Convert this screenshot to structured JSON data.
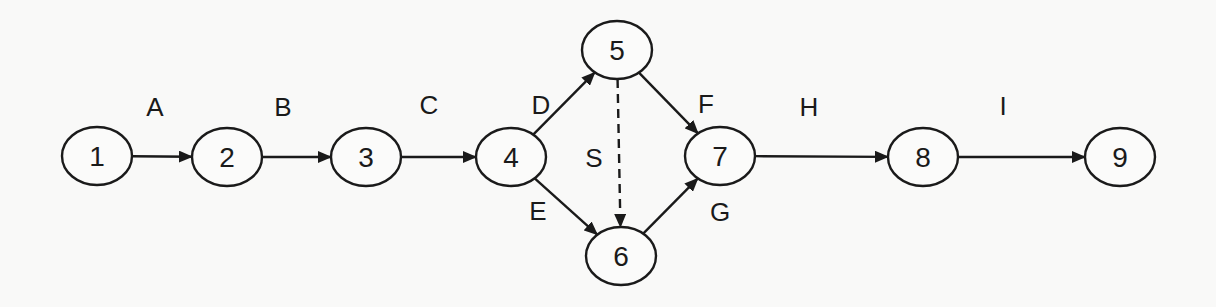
{
  "diagram": {
    "type": "activity-on-arrow network",
    "nodes": [
      {
        "id": "1",
        "label": "1",
        "cx": 97,
        "cy": 156
      },
      {
        "id": "2",
        "label": "2",
        "cx": 227,
        "cy": 157
      },
      {
        "id": "3",
        "label": "3",
        "cx": 366,
        "cy": 157
      },
      {
        "id": "4",
        "label": "4",
        "cx": 511,
        "cy": 157
      },
      {
        "id": "5",
        "label": "5",
        "cx": 617,
        "cy": 50
      },
      {
        "id": "6",
        "label": "6",
        "cx": 621,
        "cy": 256
      },
      {
        "id": "7",
        "label": "7",
        "cx": 720,
        "cy": 156
      },
      {
        "id": "8",
        "label": "8",
        "cx": 923,
        "cy": 157
      },
      {
        "id": "9",
        "label": "9",
        "cx": 1120,
        "cy": 157
      }
    ],
    "edges": [
      {
        "label": "A",
        "from": "1",
        "to": "2",
        "style": "solid",
        "lx": 155,
        "ly": 107
      },
      {
        "label": "B",
        "from": "2",
        "to": "3",
        "style": "solid",
        "lx": 283,
        "ly": 107
      },
      {
        "label": "C",
        "from": "3",
        "to": "4",
        "style": "solid",
        "lx": 429,
        "ly": 105
      },
      {
        "label": "D",
        "from": "4",
        "to": "5",
        "style": "solid",
        "lx": 541,
        "ly": 105
      },
      {
        "label": "E",
        "from": "4",
        "to": "6",
        "style": "solid",
        "lx": 538,
        "ly": 211
      },
      {
        "label": "S",
        "from": "5",
        "to": "6",
        "style": "dashed",
        "lx": 594,
        "ly": 158
      },
      {
        "label": "F",
        "from": "5",
        "to": "7",
        "style": "solid",
        "lx": 706,
        "ly": 104
      },
      {
        "label": "G",
        "from": "6",
        "to": "7",
        "style": "solid",
        "lx": 720,
        "ly": 212
      },
      {
        "label": "H",
        "from": "7",
        "to": "8",
        "style": "solid",
        "lx": 809,
        "ly": 107
      },
      {
        "label": "I",
        "from": "8",
        "to": "9",
        "style": "solid",
        "lx": 1003,
        "ly": 106
      }
    ]
  }
}
